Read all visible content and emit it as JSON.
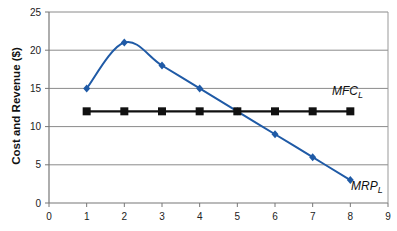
{
  "chart_data": {
    "type": "line",
    "title": "",
    "xlabel": "",
    "ylabel": "Cost and Revenue ($)",
    "xlim": [
      0,
      9
    ],
    "ylim": [
      0,
      25
    ],
    "x_ticks": [
      0,
      1,
      2,
      3,
      4,
      5,
      6,
      7,
      8,
      9
    ],
    "y_ticks": [
      0,
      5,
      10,
      15,
      20,
      25
    ],
    "grid": "horizontal",
    "legend": "inline labels",
    "x": [
      1,
      2,
      3,
      4,
      5,
      6,
      7,
      8
    ],
    "series": [
      {
        "name": "MRP_L",
        "label_main": "MRP",
        "label_sub": "L",
        "color": "#1f5aa6",
        "marker": "diamond",
        "smooth": true,
        "values": [
          15,
          21,
          18,
          15,
          12,
          9,
          6,
          3
        ]
      },
      {
        "name": "MFC_L",
        "label_main": "MFC",
        "label_sub": "L",
        "color": "#111111",
        "marker": "square",
        "smooth": false,
        "values": [
          12,
          12,
          12,
          12,
          12,
          12,
          12,
          12
        ]
      }
    ]
  }
}
